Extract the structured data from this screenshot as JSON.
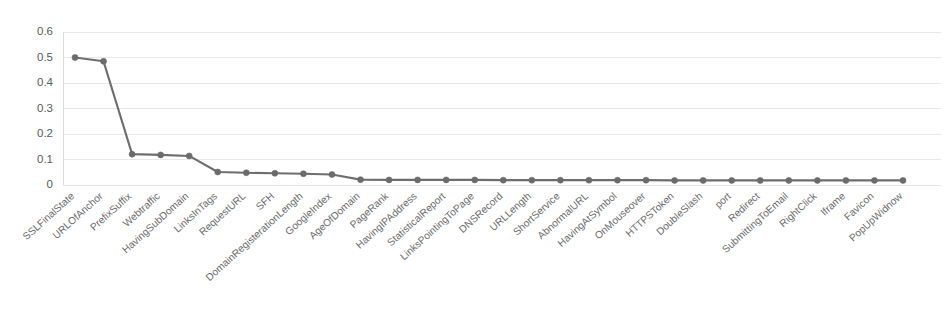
{
  "chart_data": {
    "type": "line",
    "title": "",
    "subtitle": "",
    "xlabel": "",
    "ylabel": "",
    "grid": true,
    "legend": false,
    "legend_position": "none",
    "ylim": [
      0,
      0.6
    ],
    "yticks": [
      0,
      0.1,
      0.2,
      0.3,
      0.4,
      0.5,
      0.6
    ],
    "ytick_labels": [
      "0",
      "0.1",
      "0.2",
      "0.3",
      "0.4",
      "0.5",
      "0.6"
    ],
    "marker": "circle",
    "line_color": "#6e6e6e",
    "marker_color": "#6b6b6b",
    "grid_color": "#e8e8ee",
    "categories": [
      "SSLFinalState",
      "URLOfAnchor",
      "PrefixSuffix",
      "Webtraffic",
      "HavingSubDomain",
      "LinksInTags",
      "RequestURL",
      "SFH",
      "DomainRegisterationLength",
      "GoogleIndex",
      "AgeOfDomain",
      "PageRank",
      "HavingIPAddress",
      "StatisticalReport",
      "LinksPointingToPage",
      "DNSRecord",
      "URLLength",
      "ShortService",
      "AbnormalURL",
      "HavingAtSymbol",
      "OnMouseover",
      "HTTPSToken",
      "DoubleSlash",
      "port",
      "Redirect",
      "SubmittingToEmail",
      "RightClick",
      "Iframe",
      "Favicon",
      "PopUpWidnow"
    ],
    "values": [
      0.5,
      0.485,
      0.121,
      0.118,
      0.114,
      0.051,
      0.048,
      0.046,
      0.044,
      0.041,
      0.021,
      0.02,
      0.02,
      0.02,
      0.02,
      0.019,
      0.019,
      0.019,
      0.019,
      0.019,
      0.019,
      0.018,
      0.018,
      0.018,
      0.018,
      0.018,
      0.018,
      0.018,
      0.018,
      0.018
    ]
  },
  "plot_geometry": {
    "left": 75,
    "right": 903,
    "top": 32,
    "bottom": 185
  }
}
